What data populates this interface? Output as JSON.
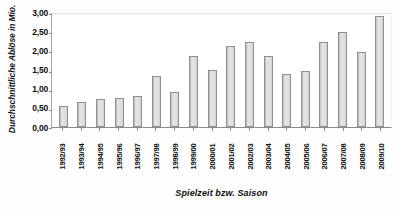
{
  "chart_data": {
    "type": "bar",
    "title": "",
    "xlabel": "Spielzeit bzw. Saison",
    "ylabel": "Durchschnittliche Ablöse in Mio.",
    "categories": [
      "1992/93",
      "1993/94",
      "1994/95",
      "1995/96",
      "1996/97",
      "1997/98",
      "1998/99",
      "1999/00",
      "2000/01",
      "2001/02",
      "2002/03",
      "2003/04",
      "2004/05",
      "2005/06",
      "2006/07",
      "2007/08",
      "2008/09",
      "2009/10"
    ],
    "values": [
      0.55,
      0.65,
      0.72,
      0.75,
      0.82,
      1.32,
      0.92,
      1.85,
      1.48,
      2.12,
      2.22,
      1.85,
      1.38,
      1.45,
      2.22,
      2.48,
      1.95,
      2.9
    ],
    "ylim": [
      0,
      3.0
    ],
    "ytick_values": [
      0,
      0.5,
      1.0,
      1.5,
      2.0,
      2.5,
      3.0
    ],
    "ytick_labels": [
      "0,00",
      "0,50",
      "1,00",
      "1,50",
      "2,00",
      "2,50",
      "3,00"
    ],
    "grid": false,
    "legend": false,
    "bar_fill_color": "#dcdcdc",
    "bar_border_color": "#8f8f8f",
    "axis_color": "#8a8a8a",
    "text_color": "#0d0d0d",
    "background_color": "#ffffff"
  }
}
